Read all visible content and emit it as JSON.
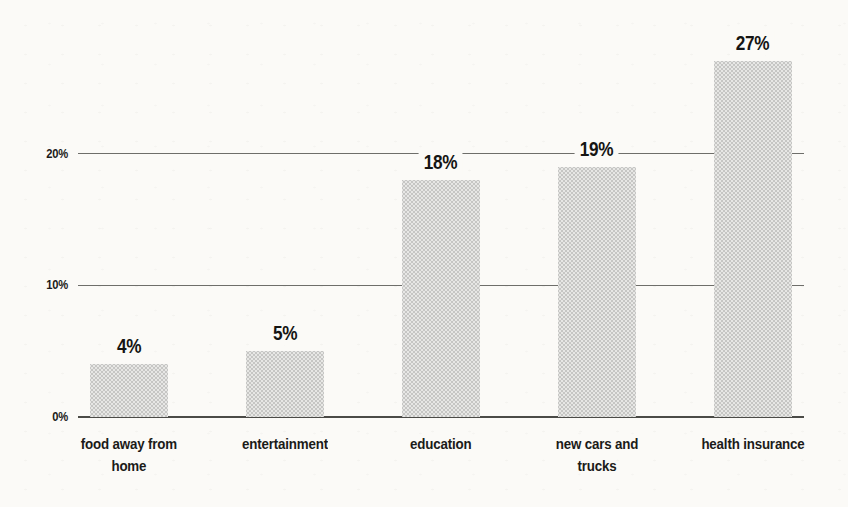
{
  "chart_data": {
    "type": "bar",
    "title": "",
    "xlabel": "",
    "ylabel": "",
    "categories": [
      "food away from home",
      "entertainment",
      "education",
      "new cars and trucks",
      "health insurance"
    ],
    "category_display_lines": [
      [
        "food away from",
        "home"
      ],
      [
        "entertainment"
      ],
      [
        "education"
      ],
      [
        "new cars and",
        "trucks"
      ],
      [
        "health insurance"
      ]
    ],
    "values": [
      4,
      5,
      18,
      19,
      27
    ],
    "value_labels": [
      "4%",
      "5%",
      "18%",
      "19%",
      "27%"
    ],
    "yticks": [
      {
        "value": 0,
        "label": "0%"
      },
      {
        "value": 10,
        "label": "10%"
      },
      {
        "value": 20,
        "label": "20%"
      }
    ],
    "ylim": [
      0,
      28
    ],
    "grid": "horizontal-behind-bars",
    "legend": "none",
    "colors": {
      "bar_fill": "#d6d6d4",
      "bar_dot": "#c6c6c4",
      "text": "#1b1b19",
      "gridline": "#6e6e6a",
      "axis_line": "#4b4b47",
      "paper": "#fbfaf7"
    }
  }
}
